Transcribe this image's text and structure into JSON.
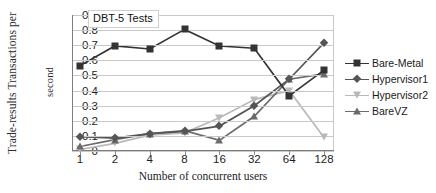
{
  "chart_data": {
    "type": "line",
    "title": "DBT-5 Tests",
    "xlabel": "Number of concurrent users",
    "ylabel": "Trade-results Transactions per second",
    "ylabel_line1": "Trade-results Transactions per",
    "ylabel_line2": "second",
    "categories": [
      "1",
      "2",
      "4",
      "8",
      "16",
      "32",
      "64",
      "128"
    ],
    "ylim": [
      0,
      0.9
    ],
    "yticks": [
      "0",
      "0.1",
      "0.2",
      "0.3",
      "0.4",
      "0.5",
      "0.6",
      "0.7",
      "0.8",
      "0.9"
    ],
    "ytick_values": [
      0,
      0.1,
      0.2,
      0.3,
      0.4,
      0.5,
      0.6,
      0.7,
      0.8,
      0.9
    ],
    "grid": true,
    "legend_position": "right",
    "series": [
      {
        "name": "Bare-Metal",
        "marker": "square",
        "color": "#333333",
        "values": [
          0.565,
          0.695,
          0.675,
          0.805,
          0.695,
          0.68,
          0.365,
          0.535
        ]
      },
      {
        "name": "Hypervisor1",
        "marker": "diamond",
        "color": "#555555",
        "values": [
          0.095,
          0.085,
          0.115,
          0.13,
          0.165,
          0.3,
          0.475,
          0.715
        ]
      },
      {
        "name": "Hypervisor2",
        "marker": "triangle-down",
        "color": "#b9b9b9",
        "values": [
          0.01,
          0.05,
          0.105,
          0.12,
          0.22,
          0.34,
          0.4,
          0.09
        ]
      },
      {
        "name": "BareVZ",
        "marker": "triangle-up",
        "color": "#6b6b6b",
        "values": [
          0.03,
          0.075,
          0.115,
          0.135,
          0.07,
          0.23,
          0.475,
          0.51
        ]
      }
    ]
  }
}
